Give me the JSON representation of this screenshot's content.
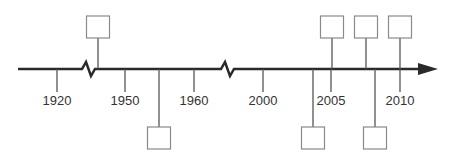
{
  "diagram": {
    "type": "timeline",
    "colors": {
      "axis": "#2a2a2a",
      "line": "#555555",
      "box_border": "#8a8a8a",
      "label": "#333333",
      "background": "#ffffff"
    },
    "ticks": [
      {
        "label": "1920",
        "x": 57
      },
      {
        "label": "1950",
        "x": 125
      },
      {
        "label": "1960",
        "x": 194
      },
      {
        "label": "2000",
        "x": 263
      },
      {
        "label": "2005",
        "x": 331
      },
      {
        "label": "2010",
        "x": 400
      }
    ],
    "breaks": [
      {
        "x": 89
      },
      {
        "x": 228
      }
    ],
    "events_above": [
      {
        "x": 98,
        "label": ""
      },
      {
        "x": 332,
        "label": ""
      },
      {
        "x": 366,
        "label": ""
      },
      {
        "x": 400,
        "label": ""
      }
    ],
    "events_below": [
      {
        "x": 159,
        "label": ""
      },
      {
        "x": 313,
        "label": ""
      },
      {
        "x": 375,
        "label": ""
      }
    ]
  }
}
